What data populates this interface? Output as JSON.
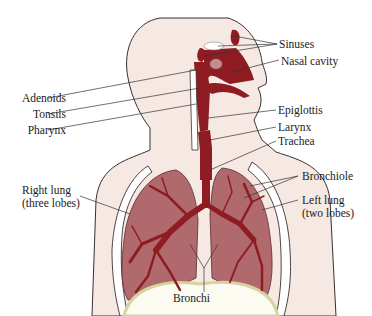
{
  "diagram": {
    "colors": {
      "skin": "#f6e8e3",
      "outline": "#3a3030",
      "airway": "#8e1c22",
      "lung": "#b06a6e",
      "lung_dark": "#9a4f55",
      "bone": "#ffffff",
      "diaphragm": "#f3efc8",
      "label_line": "#333333"
    },
    "labels": {
      "sinuses": "Sinuses",
      "nasal_cavity": "Nasal cavity",
      "adenoids": "Adenoids",
      "tonsils": "Tonsils",
      "pharynx": "Pharynx",
      "epiglottis": "Epiglottis",
      "larynx": "Larynx",
      "trachea": "Trachea",
      "bronchiole": "Bronchiole",
      "right_lung_1": "Right lung",
      "right_lung_2": "(three lobes)",
      "left_lung_1": "Left lung",
      "left_lung_2": "(two lobes)",
      "bronchi": "Bronchi"
    }
  }
}
